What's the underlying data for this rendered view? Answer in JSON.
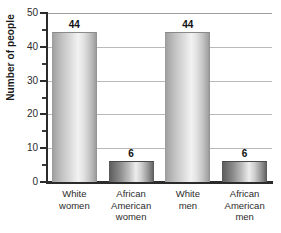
{
  "chart_data": {
    "type": "bar",
    "title": "",
    "subtitle": "",
    "xlabel": "",
    "ylabel": "Number of people",
    "ylim": [
      0,
      50
    ],
    "ytick_step": 10,
    "yminor_step": 5,
    "grid": "horizontal",
    "legend": "none",
    "categories": [
      "White women",
      "African American women",
      "White men",
      "African American men"
    ],
    "category_lines": [
      [
        "White",
        "women"
      ],
      [
        "African",
        "American",
        "women"
      ],
      [
        "White",
        "men"
      ],
      [
        "African",
        "American",
        "men"
      ]
    ],
    "values": [
      44,
      6,
      44,
      6
    ],
    "value_labels": [
      "44",
      "6",
      "44",
      "6"
    ],
    "ytick_labels": [
      "0",
      "10",
      "20",
      "30",
      "40",
      "50"
    ],
    "ytick_values": [
      0,
      10,
      20,
      30,
      40,
      50
    ],
    "yminor_values": [
      5,
      15,
      25,
      35,
      45
    ],
    "colors": {
      "bar_tall_light": "#f2f2f2",
      "bar_tall_dark": "#8f8f8f",
      "bar_short_light": "#ededed",
      "bar_short_dark": "#565656",
      "axis": "#2b2b2b",
      "gridline": "#b9b9b9",
      "text": "#2b2b2b",
      "background": "#ffffff"
    }
  }
}
